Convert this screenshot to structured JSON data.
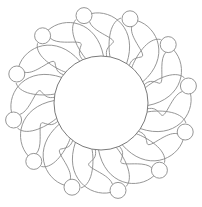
{
  "artwork": {
    "kind": "line-art coloring page",
    "description": "Central circle surrounded by twelve swirling tendril petals, each ending in a small round bulb",
    "petal_count": 12,
    "line_color": "#8a8a8a",
    "fill_color": "#ffffff",
    "background": "#ffffff",
    "center": [
      101,
      103
    ],
    "core_radius": 47,
    "bulb_ring_radius": 89,
    "bulb_radius": 8
  }
}
